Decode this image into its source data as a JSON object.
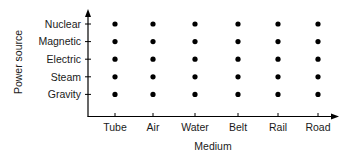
{
  "chart_data": {
    "type": "scatter",
    "title": "",
    "xlabel": "Medium",
    "ylabel": "Power source",
    "x_categories": [
      "Tube",
      "Air",
      "Water",
      "Belt",
      "Rail",
      "Road"
    ],
    "y_categories": [
      "Gravity",
      "Steam",
      "Electric",
      "Magnetic",
      "Nuclear"
    ],
    "points": [
      {
        "x": "Tube",
        "y": "Gravity"
      },
      {
        "x": "Tube",
        "y": "Steam"
      },
      {
        "x": "Tube",
        "y": "Electric"
      },
      {
        "x": "Tube",
        "y": "Magnetic"
      },
      {
        "x": "Tube",
        "y": "Nuclear"
      },
      {
        "x": "Air",
        "y": "Gravity"
      },
      {
        "x": "Air",
        "y": "Steam"
      },
      {
        "x": "Air",
        "y": "Electric"
      },
      {
        "x": "Air",
        "y": "Magnetic"
      },
      {
        "x": "Air",
        "y": "Nuclear"
      },
      {
        "x": "Water",
        "y": "Gravity"
      },
      {
        "x": "Water",
        "y": "Steam"
      },
      {
        "x": "Water",
        "y": "Electric"
      },
      {
        "x": "Water",
        "y": "Magnetic"
      },
      {
        "x": "Water",
        "y": "Nuclear"
      },
      {
        "x": "Belt",
        "y": "Gravity"
      },
      {
        "x": "Belt",
        "y": "Steam"
      },
      {
        "x": "Belt",
        "y": "Electric"
      },
      {
        "x": "Belt",
        "y": "Magnetic"
      },
      {
        "x": "Belt",
        "y": "Nuclear"
      },
      {
        "x": "Rail",
        "y": "Gravity"
      },
      {
        "x": "Rail",
        "y": "Steam"
      },
      {
        "x": "Rail",
        "y": "Electric"
      },
      {
        "x": "Rail",
        "y": "Magnetic"
      },
      {
        "x": "Rail",
        "y": "Nuclear"
      },
      {
        "x": "Road",
        "y": "Gravity"
      },
      {
        "x": "Road",
        "y": "Steam"
      },
      {
        "x": "Road",
        "y": "Electric"
      },
      {
        "x": "Road",
        "y": "Magnetic"
      },
      {
        "x": "Road",
        "y": "Nuclear"
      }
    ],
    "grid": false,
    "legend": null,
    "axes_arrows": true,
    "colors": {
      "marker": "#000000",
      "axis": "#000000"
    }
  }
}
